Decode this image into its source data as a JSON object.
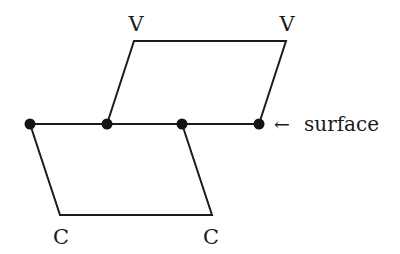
{
  "diagram": {
    "colors": {
      "line": "#1c1c1c",
      "dot": "#151515",
      "text": "#1a1a1a",
      "background": "#ffffff"
    },
    "labels": {
      "top_left": "V",
      "top_right": "V",
      "bottom_left": "C",
      "bottom_right": "C",
      "surface_arrow": "←",
      "surface": "surface"
    },
    "nodes": [
      {
        "id": "n1",
        "x": 30,
        "y": 124
      },
      {
        "id": "n2",
        "x": 107,
        "y": 124
      },
      {
        "id": "n3",
        "x": 182,
        "y": 124
      },
      {
        "id": "n4",
        "x": 259,
        "y": 124
      }
    ],
    "upper_parallelogram": {
      "points": [
        [
          107,
          124
        ],
        [
          134,
          41
        ],
        [
          286,
          41
        ],
        [
          259,
          124
        ]
      ]
    },
    "lower_parallelogram": {
      "points": [
        [
          30,
          124
        ],
        [
          60,
          215
        ],
        [
          212,
          215
        ],
        [
          182,
          124
        ]
      ]
    }
  }
}
